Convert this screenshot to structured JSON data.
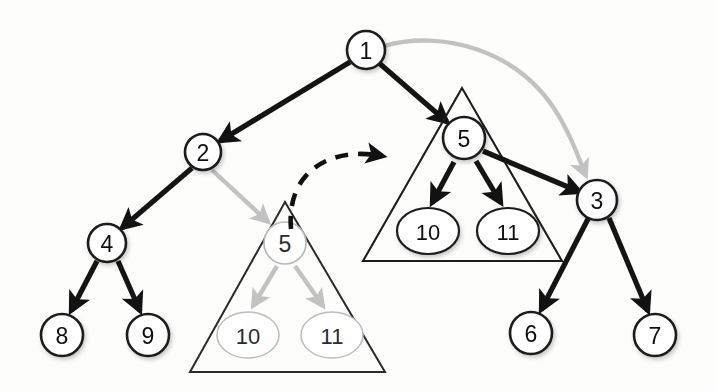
{
  "figure": {
    "colors": {
      "node_stroke": "#1a1a1a",
      "edge": "#141414",
      "faded_edge": "#c2c2c2",
      "faded_node": "#b9b9b9",
      "triangle": "#1d1d1d",
      "background": "#fdfdfc"
    }
  },
  "nodes": [
    {
      "id": "n1",
      "label": "1",
      "cx": 366,
      "cy": 50,
      "r": 19,
      "shape": "circle",
      "state": "active"
    },
    {
      "id": "n2",
      "label": "2",
      "cx": 203,
      "cy": 152,
      "r": 18,
      "shape": "circle",
      "state": "active"
    },
    {
      "id": "n3",
      "label": "3",
      "cx": 597,
      "cy": 200,
      "r": 20,
      "shape": "circle",
      "state": "active"
    },
    {
      "id": "n4",
      "label": "4",
      "cx": 107,
      "cy": 243,
      "r": 19,
      "shape": "circle",
      "state": "active"
    },
    {
      "id": "n8",
      "label": "8",
      "cx": 62,
      "cy": 335,
      "r": 21,
      "shape": "circle",
      "state": "active"
    },
    {
      "id": "n9",
      "label": "9",
      "cx": 148,
      "cy": 335,
      "r": 21,
      "shape": "circle",
      "state": "active"
    },
    {
      "id": "n6",
      "label": "6",
      "cx": 531,
      "cy": 333,
      "r": 21,
      "shape": "circle",
      "state": "active"
    },
    {
      "id": "n7",
      "label": "7",
      "cx": 655,
      "cy": 335,
      "r": 21,
      "shape": "circle",
      "state": "active"
    },
    {
      "id": "n5new",
      "label": "5",
      "cx": 464,
      "cy": 138,
      "r": 21,
      "shape": "circle",
      "state": "active"
    },
    {
      "id": "n10new",
      "label": "10",
      "cx": 428,
      "cy": 231,
      "rx": 31,
      "ry": 23,
      "shape": "ellipse",
      "state": "active"
    },
    {
      "id": "n11new",
      "label": "11",
      "cx": 508,
      "cy": 231,
      "rx": 31,
      "ry": 23,
      "shape": "ellipse",
      "state": "active"
    },
    {
      "id": "n5old",
      "label": "5",
      "cx": 285,
      "cy": 243,
      "r": 21,
      "shape": "circle",
      "state": "faded"
    },
    {
      "id": "n10old",
      "label": "10",
      "cx": 248,
      "cy": 335,
      "rx": 31,
      "ry": 23,
      "shape": "ellipse",
      "state": "faded"
    },
    {
      "id": "n11old",
      "label": "11",
      "cx": 332,
      "cy": 335,
      "rx": 31,
      "ry": 23,
      "shape": "ellipse",
      "state": "faded"
    }
  ],
  "edges": [
    {
      "id": "e1_2",
      "from": "1",
      "to": "2",
      "style": "solid-black",
      "note": "root to left child"
    },
    {
      "id": "e1_5new",
      "from": "1",
      "to": "5 (new)",
      "style": "solid-black",
      "note": "root to relocated subtree root"
    },
    {
      "id": "e1_3",
      "from": "1",
      "to": "3",
      "style": "curved-gray",
      "note": "old root link to 3, faded"
    },
    {
      "id": "e2_4",
      "from": "2",
      "to": "4",
      "style": "solid-black",
      "note": ""
    },
    {
      "id": "e4_8",
      "from": "4",
      "to": "8",
      "style": "solid-black",
      "note": ""
    },
    {
      "id": "e4_9",
      "from": "4",
      "to": "9",
      "style": "solid-black",
      "note": ""
    },
    {
      "id": "e2_5old",
      "from": "2",
      "to": "5 (old)",
      "style": "solid-gray",
      "note": "old parent link to subtree, faded"
    },
    {
      "id": "e5old_10",
      "from": "5 (old)",
      "to": "10 (old)",
      "style": "solid-gray",
      "note": ""
    },
    {
      "id": "e5old_11",
      "from": "5 (old)",
      "to": "11 (old)",
      "style": "solid-gray",
      "note": ""
    },
    {
      "id": "e5new_10",
      "from": "5 (new)",
      "to": "10 (new)",
      "style": "solid-black",
      "note": ""
    },
    {
      "id": "e5new_11",
      "from": "5 (new)",
      "to": "11 (new)",
      "style": "solid-black",
      "note": ""
    },
    {
      "id": "e5new_3",
      "from": "5 (new)",
      "to": "3",
      "style": "solid-black",
      "note": "new parent link to 3"
    },
    {
      "id": "e3_6",
      "from": "3",
      "to": "6",
      "style": "solid-black",
      "note": ""
    },
    {
      "id": "e3_7",
      "from": "3",
      "to": "7",
      "style": "solid-black",
      "note": ""
    },
    {
      "id": "e_move",
      "from": "subtree 5 (old position)",
      "to": "subtree 5 (new position)",
      "style": "dashed-black",
      "note": "relocation of subtree"
    }
  ],
  "groups": [
    {
      "id": "triangle-old",
      "label": "subtree rooted at 5 (old position)",
      "apex": [
        285,
        202
      ],
      "left": [
        190,
        372
      ],
      "right": [
        385,
        372
      ],
      "state": "faded"
    },
    {
      "id": "triangle-new",
      "label": "subtree rooted at 5 (new position)",
      "apex": [
        462,
        88
      ],
      "left": [
        363,
        261
      ],
      "right": [
        562,
        261
      ],
      "state": "active"
    }
  ]
}
